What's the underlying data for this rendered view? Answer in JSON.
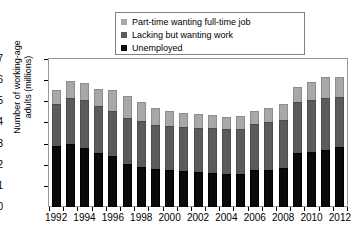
{
  "chart_data": {
    "type": "bar",
    "subtype": "stacked-vertical",
    "title": "",
    "xlabel": "",
    "ylabel": "Number of working-age adults (millions)",
    "ylabel_lines": [
      "Number of working-age",
      "adults (millions)"
    ],
    "ylim": [
      0,
      7
    ],
    "ytick_values": [
      0,
      1,
      2,
      3,
      4,
      5,
      6,
      7
    ],
    "ytick_labels": [
      "0",
      "1",
      "2",
      "3",
      "4",
      "5",
      "6",
      "7"
    ],
    "grid": false,
    "legend_position": "top-center",
    "categories": [
      1992,
      1993,
      1994,
      1995,
      1996,
      1997,
      1998,
      1999,
      2000,
      2001,
      2002,
      2003,
      2004,
      2005,
      2006,
      2007,
      2008,
      2009,
      2010,
      2011,
      2012
    ],
    "xtick_labels": [
      "1992",
      "",
      "1994",
      "",
      "1996",
      "",
      "1998",
      "",
      "2000",
      "",
      "2002",
      "",
      "2004",
      "",
      "2006",
      "",
      "2008",
      "",
      "2010",
      "",
      "2012"
    ],
    "series": [
      {
        "name": "Unemployed",
        "color": "#0a0a0a",
        "values": [
          2.9,
          3.0,
          2.8,
          2.55,
          2.4,
          2.05,
          1.9,
          1.8,
          1.75,
          1.7,
          1.65,
          1.6,
          1.55,
          1.55,
          1.75,
          1.75,
          1.85,
          2.55,
          2.6,
          2.7,
          2.85
        ]
      },
      {
        "name": "Lacking but wanting work",
        "color": "#5b5b5b",
        "values": [
          1.95,
          2.15,
          2.25,
          2.25,
          2.15,
          2.15,
          2.15,
          2.1,
          2.1,
          2.1,
          2.1,
          2.15,
          2.15,
          2.15,
          2.2,
          2.25,
          2.25,
          2.4,
          2.45,
          2.45,
          2.35
        ]
      },
      {
        "name": "Part-time wanting full-time job",
        "color": "#a8a8a8",
        "values": [
          0.7,
          0.8,
          0.8,
          0.8,
          1.0,
          1.05,
          0.9,
          0.8,
          0.7,
          0.65,
          0.65,
          0.6,
          0.55,
          0.6,
          0.6,
          0.7,
          0.75,
          0.75,
          0.85,
          1.0,
          0.95
        ]
      }
    ],
    "totals": [
      5.55,
      5.95,
      5.85,
      5.6,
      5.55,
      5.25,
      4.95,
      4.7,
      4.55,
      4.45,
      4.4,
      4.35,
      4.25,
      4.3,
      4.55,
      4.7,
      4.85,
      5.7,
      5.9,
      6.15,
      6.15
    ]
  },
  "legend": {
    "items": [
      {
        "label": "Part-time wanting full-time job",
        "color": "#a8a8a8"
      },
      {
        "label": "Lacking but wanting work",
        "color": "#5b5b5b"
      },
      {
        "label": "Unemployed",
        "color": "#0a0a0a"
      }
    ]
  },
  "colors": {
    "frame": "#9a9a9a",
    "axis": "#000000",
    "background": "#ffffff"
  }
}
